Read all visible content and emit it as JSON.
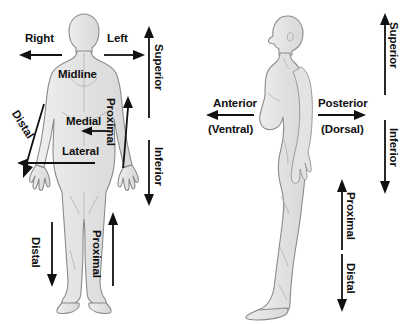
{
  "diagram": {
    "background_color": "#ffffff",
    "body_fill": "#e6e6e6",
    "body_stroke": "#7a7a7a",
    "arrow_color": "#111111",
    "text_color": "#0f0f0f",
    "figures": [
      {
        "name": "anterior-view-female-body",
        "view": "anterior (front) view"
      },
      {
        "name": "lateral-view-female-body",
        "view": "lateral (side) view"
      }
    ],
    "left_panel": {
      "name": "anterior-view-panel",
      "labels": [
        {
          "id": "right",
          "text": "Right",
          "orientation": "horizontal",
          "arrow": "left"
        },
        {
          "id": "left",
          "text": "Left",
          "orientation": "horizontal",
          "arrow": "right"
        },
        {
          "id": "midline",
          "text": "Midline",
          "orientation": "horizontal",
          "arrow": "none"
        },
        {
          "id": "medial",
          "text": "Medial",
          "orientation": "horizontal",
          "arrow": "left"
        },
        {
          "id": "lateral",
          "text": "Lateral",
          "orientation": "horizontal",
          "arrow": "left"
        },
        {
          "id": "superior",
          "text": "Superior",
          "orientation": "rotated-90",
          "arrow": "up"
        },
        {
          "id": "inferior",
          "text": "Inferior",
          "orientation": "rotated-90",
          "arrow": "down"
        },
        {
          "id": "proximal-arm",
          "text": "Proximal",
          "orientation": "rotated-90",
          "arrow": "up"
        },
        {
          "id": "distal-arm",
          "text": "Distal",
          "orientation": "diagonal",
          "arrow": "down"
        },
        {
          "id": "proximal-leg",
          "text": "Proximal",
          "orientation": "rotated-90",
          "arrow": "up"
        },
        {
          "id": "distal-leg",
          "text": "Distal",
          "orientation": "rotated-90",
          "arrow": "down"
        }
      ]
    },
    "right_panel": {
      "name": "lateral-view-panel",
      "labels": [
        {
          "id": "anterior",
          "text": "Anterior",
          "sub": "(Ventral)",
          "orientation": "horizontal",
          "arrow": "left"
        },
        {
          "id": "posterior",
          "text": "Posterior",
          "sub": "(Dorsal)",
          "orientation": "horizontal",
          "arrow": "right"
        },
        {
          "id": "superior",
          "text": "Superior",
          "orientation": "rotated-90",
          "arrow": "up"
        },
        {
          "id": "inferior",
          "text": "Inferior",
          "orientation": "rotated-90",
          "arrow": "down"
        },
        {
          "id": "proximal-leg",
          "text": "Proximal",
          "orientation": "rotated-90",
          "arrow": "up"
        },
        {
          "id": "distal-leg",
          "text": "Distal",
          "orientation": "rotated-90",
          "arrow": "down"
        }
      ]
    }
  }
}
